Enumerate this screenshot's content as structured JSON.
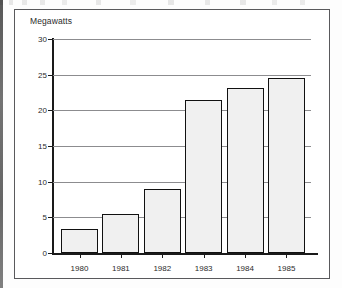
{
  "chart_data": {
    "type": "bar",
    "title": "",
    "subtitle": "",
    "xlabel": "",
    "ylabel": "Megawatts",
    "categories": [
      "1980",
      "1981",
      "1982",
      "1983",
      "1984",
      "1985"
    ],
    "values": [
      3.3,
      5.5,
      9.0,
      21.5,
      23.2,
      24.5
    ],
    "ylim": [
      0,
      30
    ],
    "yticks": [
      0,
      5,
      10,
      15,
      20,
      25,
      30
    ],
    "ytick_labels": [
      "0",
      "5",
      "10",
      "15",
      "20",
      "25",
      "30"
    ],
    "grid": true,
    "legend": null,
    "legend_position": "none",
    "series": [
      {
        "name": "Megawatts",
        "values": [
          3.3,
          5.5,
          9.0,
          21.5,
          23.2,
          24.5
        ]
      }
    ],
    "colors": {
      "bar_fill": "#f0f0f0",
      "bar_edge": "#111111",
      "gridline": "#8c8c8f",
      "axis": "#1a1a1a",
      "text": "#2b2b2b",
      "frame": "#59595c",
      "background": "#ffffff"
    }
  }
}
